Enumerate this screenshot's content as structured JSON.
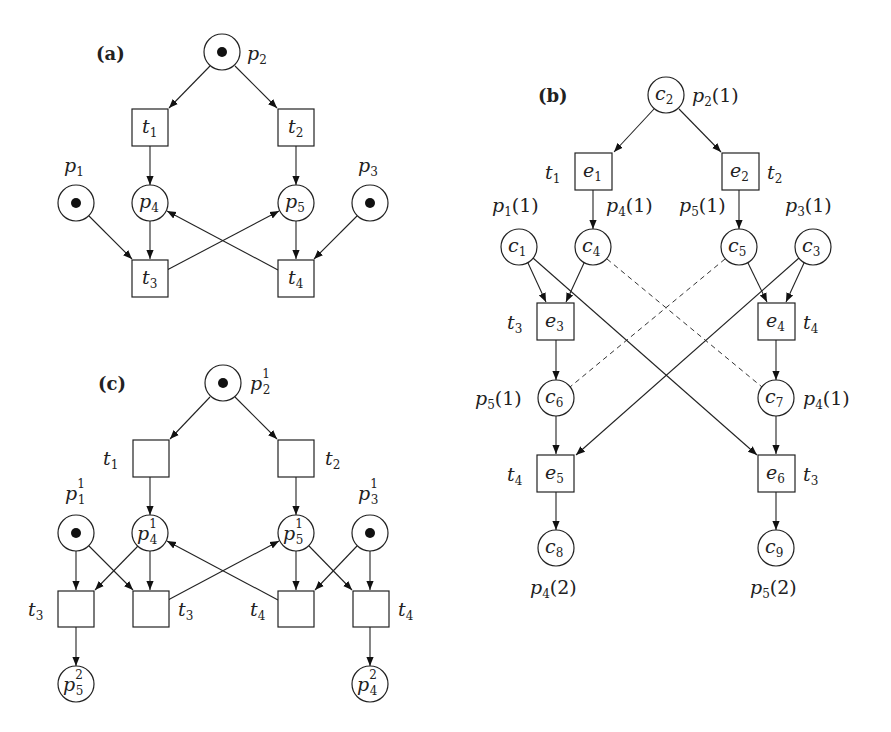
{
  "figure": {
    "panels": [
      {
        "id": "a",
        "label": "(a)",
        "title": "Petri net",
        "places": [
          {
            "id": "p1",
            "name": "p",
            "sub": "1",
            "marked": true
          },
          {
            "id": "p2",
            "name": "p",
            "sub": "2",
            "marked": true
          },
          {
            "id": "p3",
            "name": "p",
            "sub": "3",
            "marked": true
          },
          {
            "id": "p4",
            "name": "p",
            "sub": "4",
            "marked": false
          },
          {
            "id": "p5",
            "name": "p",
            "sub": "5",
            "marked": false
          }
        ],
        "transitions": [
          {
            "id": "t1",
            "name": "t",
            "sub": "1"
          },
          {
            "id": "t2",
            "name": "t",
            "sub": "2"
          },
          {
            "id": "t3",
            "name": "t",
            "sub": "3"
          },
          {
            "id": "t4",
            "name": "t",
            "sub": "4"
          }
        ],
        "arcs": [
          [
            "p2",
            "t1"
          ],
          [
            "p2",
            "t2"
          ],
          [
            "t1",
            "p4"
          ],
          [
            "t2",
            "p5"
          ],
          [
            "p1",
            "t3"
          ],
          [
            "p4",
            "t3"
          ],
          [
            "p5",
            "t4"
          ],
          [
            "p3",
            "t4"
          ],
          [
            "t3",
            "p5"
          ],
          [
            "t4",
            "p4"
          ]
        ]
      },
      {
        "id": "b",
        "label": "(b)",
        "title": "Unfolding / occurrence net",
        "conditions": [
          {
            "id": "c1",
            "name": "c",
            "sub": "1",
            "place": "p",
            "place_sub": "1",
            "index": "(1)"
          },
          {
            "id": "c2",
            "name": "c",
            "sub": "2",
            "place": "p",
            "place_sub": "2",
            "index": "(1)"
          },
          {
            "id": "c3",
            "name": "c",
            "sub": "3",
            "place": "p",
            "place_sub": "3",
            "index": "(1)"
          },
          {
            "id": "c4",
            "name": "c",
            "sub": "4",
            "place": "p",
            "place_sub": "4",
            "index": "(1)"
          },
          {
            "id": "c5",
            "name": "c",
            "sub": "5",
            "place": "p",
            "place_sub": "5",
            "index": "(1)"
          },
          {
            "id": "c6",
            "name": "c",
            "sub": "6",
            "place": "p",
            "place_sub": "5",
            "index": "(1)"
          },
          {
            "id": "c7",
            "name": "c",
            "sub": "7",
            "place": "p",
            "place_sub": "4",
            "index": "(1)"
          },
          {
            "id": "c8",
            "name": "c",
            "sub": "8",
            "place": "p",
            "place_sub": "4",
            "index": "(2)"
          },
          {
            "id": "c9",
            "name": "c",
            "sub": "9",
            "place": "p",
            "place_sub": "5",
            "index": "(2)"
          }
        ],
        "events": [
          {
            "id": "e1",
            "name": "e",
            "sub": "1",
            "trans": "t",
            "trans_sub": "1"
          },
          {
            "id": "e2",
            "name": "e",
            "sub": "2",
            "trans": "t",
            "trans_sub": "2"
          },
          {
            "id": "e3",
            "name": "e",
            "sub": "3",
            "trans": "t",
            "trans_sub": "3"
          },
          {
            "id": "e4",
            "name": "e",
            "sub": "4",
            "trans": "t",
            "trans_sub": "4"
          },
          {
            "id": "e5",
            "name": "e",
            "sub": "5",
            "trans": "t",
            "trans_sub": "4"
          },
          {
            "id": "e6",
            "name": "e",
            "sub": "6",
            "trans": "t",
            "trans_sub": "3"
          }
        ],
        "arcs": [
          [
            "c2",
            "e1"
          ],
          [
            "c2",
            "e2"
          ],
          [
            "e1",
            "c4"
          ],
          [
            "e2",
            "c5"
          ],
          [
            "c1",
            "e3"
          ],
          [
            "c4",
            "e3"
          ],
          [
            "c5",
            "e4"
          ],
          [
            "c3",
            "e4"
          ],
          [
            "e3",
            "c6"
          ],
          [
            "e4",
            "c7"
          ],
          [
            "c6",
            "e5"
          ],
          [
            "c3",
            "e5"
          ],
          [
            "c7",
            "e6"
          ],
          [
            "c1",
            "e6"
          ],
          [
            "e5",
            "c8"
          ],
          [
            "e6",
            "c9"
          ]
        ],
        "dashed_links": [
          [
            "c4",
            "c7"
          ],
          [
            "c5",
            "c6"
          ]
        ]
      },
      {
        "id": "c",
        "label": "(c)",
        "title": "Unfolded net with place copies",
        "places": [
          {
            "id": "p2_1",
            "name": "p",
            "sub": "2",
            "sup": "1",
            "marked": true
          },
          {
            "id": "p1_1",
            "name": "p",
            "sub": "1",
            "sup": "1",
            "marked": true
          },
          {
            "id": "p3_1",
            "name": "p",
            "sub": "3",
            "sup": "1",
            "marked": true
          },
          {
            "id": "p4_1",
            "name": "p",
            "sub": "4",
            "sup": "1",
            "marked": false
          },
          {
            "id": "p5_1",
            "name": "p",
            "sub": "5",
            "sup": "1",
            "marked": false
          },
          {
            "id": "p5_2",
            "name": "p",
            "sub": "5",
            "sup": "2",
            "marked": false
          },
          {
            "id": "p4_2",
            "name": "p",
            "sub": "4",
            "sup": "2",
            "marked": false
          }
        ],
        "transitions": [
          {
            "id": "t1",
            "name": "t",
            "sub": "1"
          },
          {
            "id": "t2",
            "name": "t",
            "sub": "2"
          },
          {
            "id": "t3a",
            "name": "t",
            "sub": "3"
          },
          {
            "id": "t3b",
            "name": "t",
            "sub": "3"
          },
          {
            "id": "t4a",
            "name": "t",
            "sub": "4"
          },
          {
            "id": "t4b",
            "name": "t",
            "sub": "4"
          }
        ]
      }
    ]
  }
}
